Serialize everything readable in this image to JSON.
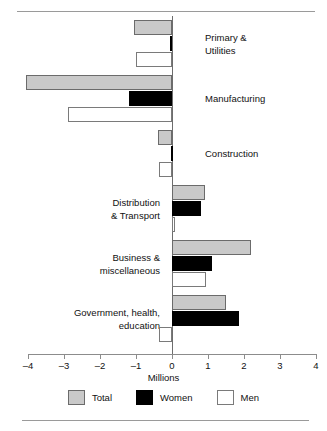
{
  "chart_data": {
    "type": "bar",
    "orientation": "horizontal",
    "title": "",
    "xlabel": "Millions",
    "ylabel": "",
    "xlim": [
      -4,
      4
    ],
    "xticks": [
      -4,
      -3,
      -2,
      -1,
      0,
      1,
      2,
      3,
      4
    ],
    "xticklabels": [
      "–4",
      "–3",
      "–2",
      "–1",
      "0",
      "1",
      "2",
      "3",
      "4"
    ],
    "grid": false,
    "legend_position": "bottom",
    "categories": [
      "Primary &\nUtilities",
      "Manufacturing",
      "Construction",
      "Distribution\n& Transport",
      "Business &\nmiscellaneous",
      "Government, health,\neducation"
    ],
    "series": [
      {
        "name": "Total",
        "color": "#c9c9c9",
        "values": [
          -1.05,
          -4.05,
          -0.38,
          0.92,
          2.2,
          1.5
        ]
      },
      {
        "name": "Women",
        "color": "#000000",
        "values": [
          -0.05,
          -1.2,
          -0.04,
          0.8,
          1.1,
          1.85
        ]
      },
      {
        "name": "Men",
        "color": "#ffffff",
        "values": [
          -1.0,
          -2.9,
          -0.35,
          0.07,
          0.95,
          -0.35
        ]
      }
    ],
    "label_side": [
      "right",
      "right",
      "right",
      "left",
      "left",
      "left"
    ]
  },
  "legend": {
    "items": [
      {
        "label": "Total",
        "style": "total"
      },
      {
        "label": "Women",
        "style": "women"
      },
      {
        "label": "Men",
        "style": "men"
      }
    ]
  },
  "axis": {
    "title": "Millions"
  }
}
